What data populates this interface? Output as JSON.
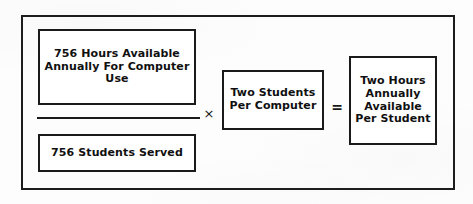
{
  "figure": {
    "type": "equation-diagram",
    "ink_color": "#1a1a1a",
    "paper_color": "#fdfdfd"
  },
  "numerator": {
    "lines": [
      "756 Hours Available",
      "Annually For Computer",
      "Use"
    ]
  },
  "denominator": {
    "lines": [
      "756 Students Served"
    ]
  },
  "operators": {
    "multiply": "×",
    "equals": "="
  },
  "multiplier": {
    "lines": [
      "Two Students",
      "Per Computer"
    ]
  },
  "result": {
    "lines": [
      "Two Hours",
      "Annually",
      "Available",
      "Per Student"
    ]
  }
}
